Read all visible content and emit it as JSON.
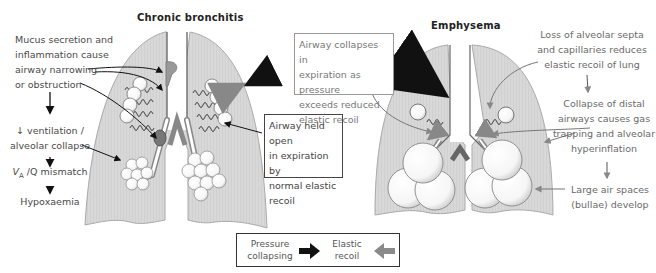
{
  "diagram": {
    "panels": [
      {
        "title": "Chronic bronchitis",
        "annotations": {
          "mucus": [
            "Mucus secretion and",
            "inflammation cause",
            "airway narrowing",
            "or obstruction"
          ],
          "ventilation": [
            "↓ ventilation /",
            "alveolar collapse"
          ],
          "mismatch": "Vₐ /Q mismatch",
          "mismatch_base": "V",
          "mismatch_sub": "A",
          "mismatch_rest": " /Q mismatch",
          "hypoxaemia": "Hypoxaemia",
          "airway_open_box": [
            "Airway held open",
            "in expiration by",
            "normal elastic",
            "recoil"
          ]
        }
      },
      {
        "title": "Emphysema",
        "annotations": {
          "collapse_box": [
            "Airway collapses in",
            "expiration as pressure",
            "exceeds reduced",
            "elastic recoil"
          ],
          "loss": [
            "Loss of alveolar septa",
            "and capillaries reduces",
            "elastic recoil of lung"
          ],
          "distal": [
            "Collapse of distal",
            "airways causes gas",
            "trapping and alveolar",
            "hyperinflation"
          ],
          "bullae": [
            "Large air spaces",
            "(bullae) develop"
          ]
        }
      }
    ],
    "legend": {
      "pressure": [
        "Pressure",
        "collapsing"
      ],
      "elastic": [
        "Elastic",
        "recoil"
      ],
      "colors": {
        "pressure_arrow": "#111111",
        "elastic_arrow": "#8a8a8a"
      }
    },
    "colors": {
      "lung_fill": "#d6d6d6",
      "lung_stroke": "#a8a8a8",
      "alveoli": "#ffffff",
      "mucus": "#9a9a9a"
    }
  }
}
